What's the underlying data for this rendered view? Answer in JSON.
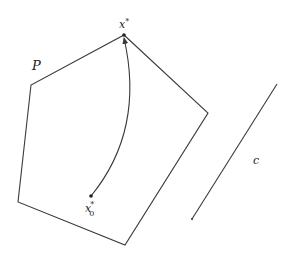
{
  "diagram": {
    "colors": {
      "stroke": "#3a3a3a",
      "background": "#ffffff",
      "text": "#222222"
    },
    "polytope": {
      "label": "P",
      "vertices": [
        [
          124,
          35
        ],
        [
          208,
          113
        ],
        [
          125,
          245
        ],
        [
          18,
          202
        ],
        [
          31,
          85
        ]
      ]
    },
    "optimum": {
      "label": "x",
      "superscript": "*",
      "point": [
        124,
        35
      ]
    },
    "start": {
      "label": "x",
      "subscript": "0",
      "superscript": "*",
      "point": [
        91,
        196
      ]
    },
    "path": {
      "from": [
        91,
        196
      ],
      "to": [
        124,
        37
      ],
      "control": [
        145,
        130
      ],
      "arrow": true
    },
    "cost_vector": {
      "label": "c",
      "from": [
        277,
        84
      ],
      "to": [
        192,
        219
      ]
    }
  }
}
